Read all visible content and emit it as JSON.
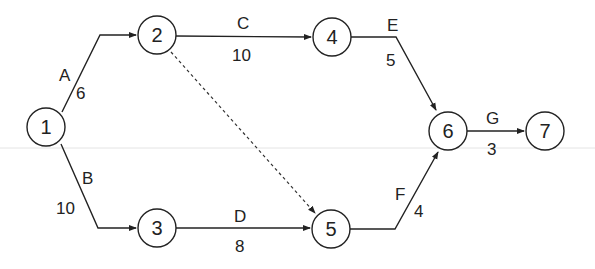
{
  "diagram": {
    "type": "activity-on-arrow network",
    "nodes": [
      {
        "id": "1",
        "label": "1"
      },
      {
        "id": "2",
        "label": "2"
      },
      {
        "id": "3",
        "label": "3"
      },
      {
        "id": "4",
        "label": "4"
      },
      {
        "id": "5",
        "label": "5"
      },
      {
        "id": "6",
        "label": "6"
      },
      {
        "id": "7",
        "label": "7"
      }
    ],
    "activities": [
      {
        "name": "A",
        "from": "1",
        "to": "2",
        "duration": "6"
      },
      {
        "name": "B",
        "from": "1",
        "to": "3",
        "duration": "10"
      },
      {
        "name": "C",
        "from": "2",
        "to": "4",
        "duration": "10"
      },
      {
        "name": "D",
        "from": "3",
        "to": "5",
        "duration": "8"
      },
      {
        "name": "E",
        "from": "4",
        "to": "6",
        "duration": "5"
      },
      {
        "name": "F",
        "from": "5",
        "to": "6",
        "duration": "4"
      },
      {
        "name": "G",
        "from": "6",
        "to": "7",
        "duration": "3"
      }
    ],
    "dummy_activities": [
      {
        "from": "2",
        "to": "5",
        "style": "dotted"
      }
    ]
  }
}
